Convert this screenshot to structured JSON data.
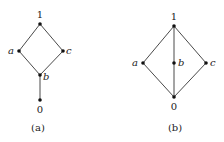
{
  "diagrams": [
    {
      "caption": "(a)",
      "nodes": {
        "top": {
          "label": "1"
        },
        "a": {
          "label": "a"
        },
        "c": {
          "label": "c"
        },
        "b": {
          "label": "b"
        },
        "bottom": {
          "label": "0"
        }
      },
      "edges": [
        [
          "1",
          "a"
        ],
        [
          "1",
          "c"
        ],
        [
          "a",
          "b"
        ],
        [
          "c",
          "b"
        ],
        [
          "b",
          "0"
        ]
      ]
    },
    {
      "caption": "(b)",
      "nodes": {
        "top": {
          "label": "1"
        },
        "a": {
          "label": "a"
        },
        "b": {
          "label": "b"
        },
        "c": {
          "label": "c"
        },
        "bottom": {
          "label": "0"
        }
      },
      "edges": [
        [
          "1",
          "a"
        ],
        [
          "1",
          "b"
        ],
        [
          "1",
          "c"
        ],
        [
          "a",
          "0"
        ],
        [
          "b",
          "0"
        ],
        [
          "c",
          "0"
        ]
      ]
    }
  ],
  "colors": {
    "edge": "#4a4a4a",
    "node": "#111111",
    "text": "#222222",
    "background": "#ffffff"
  }
}
